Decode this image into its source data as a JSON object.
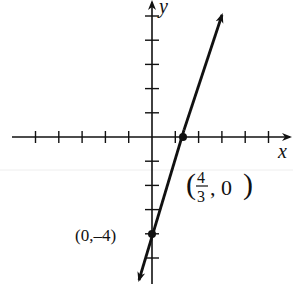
{
  "chart_data": {
    "type": "line",
    "title": "",
    "xlabel": "x",
    "ylabel": "y",
    "equation": "y = 3x - 4",
    "xlim": [
      -5,
      5
    ],
    "ylim": [
      -6,
      5
    ],
    "grid": false,
    "x_ticks": [
      -5,
      -4,
      -3,
      -2,
      -1,
      1,
      2,
      3,
      4,
      5
    ],
    "y_ticks": [
      -5,
      -4,
      -3,
      -2,
      -1,
      1,
      2,
      3,
      4,
      5
    ],
    "series": [
      {
        "name": "line",
        "x": [
          -0.55,
          3.0
        ],
        "y": [
          -5.9,
          5.3
        ]
      }
    ],
    "points": [
      {
        "x": 0,
        "y": -4,
        "label": "(0,–4)"
      },
      {
        "x": 1.3333,
        "y": 0,
        "label": "(4/3, 0)"
      }
    ],
    "annotations": {
      "y_intercept": "(0,–4)",
      "x_intercept_open": "(",
      "x_intercept_num": "4",
      "x_intercept_den": "3",
      "x_intercept_rest": ", 0)",
      "x_intercept_close": ")"
    }
  },
  "axes": {
    "x_label": "x",
    "y_label": "y"
  }
}
